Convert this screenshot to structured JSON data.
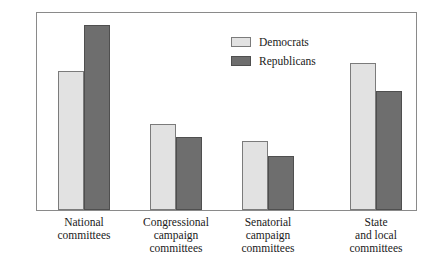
{
  "chart_data": {
    "type": "bar",
    "title": "",
    "xlabel": "",
    "ylabel": "",
    "ylim": [
      0,
      420
    ],
    "grid": false,
    "legend_position": "top-center",
    "categories": [
      "National committees",
      "Congressional campaign committees",
      "Senatorial campaign committees",
      "State and local committees"
    ],
    "category_lines": [
      [
        "National",
        "committees"
      ],
      [
        "Congressional",
        "campaign",
        "committees"
      ],
      [
        "Senatorial",
        "campaign",
        "committees"
      ],
      [
        "State",
        "and local",
        "committees"
      ]
    ],
    "yticks": [
      50,
      100,
      150,
      200,
      250,
      300,
      350,
      400
    ],
    "series": [
      {
        "name": "Democrats",
        "color": "#e2e2e2",
        "values": [
          293,
          182,
          145,
          311
        ]
      },
      {
        "name": "Republicans",
        "color": "#6e6e6e",
        "values": [
          390,
          155,
          113,
          252
        ]
      }
    ]
  },
  "legend": {
    "items": [
      {
        "label": "Democrats"
      },
      {
        "label": "Republicans"
      }
    ]
  },
  "colors": {
    "democrat_fill": "#e2e2e2",
    "republican_fill": "#6e6e6e",
    "frame": "#8a8a8a",
    "text": "#1a1a1a",
    "background": "#ffffff"
  }
}
